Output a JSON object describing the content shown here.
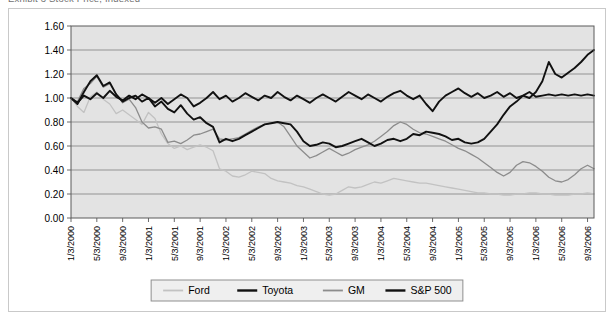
{
  "clipped_header": "Exhibit 3  Stock Price, Indexed",
  "chart_data": {
    "type": "line",
    "title": "",
    "xlabel": "",
    "ylabel": "",
    "ylim": [
      0.0,
      1.6
    ],
    "ytick_values": [
      0.0,
      0.2,
      0.4,
      0.6,
      0.8,
      1.0,
      1.2,
      1.4,
      1.6
    ],
    "ytick_labels": [
      "0.00",
      "0.20",
      "0.40",
      "0.60",
      "0.80",
      "1.00",
      "1.20",
      "1.40",
      "1.60"
    ],
    "grid": true,
    "legend_position": "bottom",
    "plot_bgcolor": "#e3e3e3",
    "x_tick_labels": [
      "1/3/2000",
      "5/3/2000",
      "9/3/2000",
      "1/3/2001",
      "5/3/2001",
      "9/3/2001",
      "1/3/2002",
      "5/3/2002",
      "9/3/2002",
      "1/3/2003",
      "5/3/2003",
      "9/3/2003",
      "1/3/2004",
      "5/3/2004",
      "9/3/2004",
      "1/3/2005",
      "5/3/2005",
      "9/3/2005",
      "1/3/2006",
      "5/3/2006",
      "9/3/2006"
    ],
    "x_tick_interval_months": 4,
    "n_points": 82,
    "series": [
      {
        "name": "Ford",
        "color": "#c2c2c2",
        "values": [
          1.0,
          0.93,
          0.88,
          1.01,
          1.05,
          0.99,
          0.95,
          0.87,
          0.9,
          0.86,
          0.82,
          0.78,
          0.88,
          0.83,
          0.7,
          0.62,
          0.58,
          0.6,
          0.57,
          0.59,
          0.61,
          0.59,
          0.56,
          0.41,
          0.39,
          0.35,
          0.34,
          0.36,
          0.39,
          0.38,
          0.37,
          0.33,
          0.31,
          0.3,
          0.29,
          0.27,
          0.26,
          0.24,
          0.22,
          0.2,
          0.19,
          0.2,
          0.23,
          0.26,
          0.25,
          0.26,
          0.28,
          0.3,
          0.29,
          0.31,
          0.33,
          0.32,
          0.31,
          0.3,
          0.29,
          0.29,
          0.28,
          0.27,
          0.26,
          0.25,
          0.24,
          0.23,
          0.22,
          0.21,
          0.21,
          0.2,
          0.2,
          0.19,
          0.19,
          0.2,
          0.2,
          0.21,
          0.21,
          0.2,
          0.2,
          0.19,
          0.19,
          0.19,
          0.2,
          0.2,
          0.21,
          0.2
        ]
      },
      {
        "name": "Toyota",
        "color": "#111111",
        "values": [
          1.0,
          0.95,
          1.05,
          1.14,
          1.19,
          1.1,
          1.13,
          1.03,
          0.97,
          1.0,
          1.02,
          0.97,
          1.0,
          0.93,
          0.97,
          0.91,
          0.88,
          0.94,
          0.87,
          0.82,
          0.84,
          0.79,
          0.76,
          0.63,
          0.66,
          0.64,
          0.66,
          0.69,
          0.72,
          0.75,
          0.78,
          0.79,
          0.8,
          0.79,
          0.78,
          0.72,
          0.64,
          0.6,
          0.61,
          0.63,
          0.62,
          0.59,
          0.6,
          0.62,
          0.64,
          0.66,
          0.63,
          0.6,
          0.62,
          0.65,
          0.66,
          0.64,
          0.66,
          0.7,
          0.69,
          0.72,
          0.71,
          0.7,
          0.68,
          0.65,
          0.66,
          0.63,
          0.62,
          0.63,
          0.66,
          0.72,
          0.78,
          0.86,
          0.93,
          0.97,
          1.02,
          1.0,
          1.05,
          1.14,
          1.3,
          1.2,
          1.17,
          1.21,
          1.25,
          1.3,
          1.36,
          1.4
        ]
      },
      {
        "name": "GM",
        "color": "#8c8c8c",
        "values": [
          1.0,
          0.97,
          1.08,
          1.12,
          1.18,
          1.09,
          1.12,
          1.03,
          0.96,
          0.99,
          0.92,
          0.8,
          0.75,
          0.76,
          0.74,
          0.63,
          0.64,
          0.62,
          0.65,
          0.69,
          0.7,
          0.72,
          0.74,
          0.66,
          0.65,
          0.66,
          0.67,
          0.7,
          0.73,
          0.76,
          0.78,
          0.79,
          0.8,
          0.76,
          0.68,
          0.6,
          0.55,
          0.5,
          0.52,
          0.55,
          0.58,
          0.55,
          0.52,
          0.54,
          0.57,
          0.59,
          0.61,
          0.64,
          0.68,
          0.72,
          0.77,
          0.8,
          0.78,
          0.74,
          0.71,
          0.7,
          0.68,
          0.66,
          0.64,
          0.61,
          0.58,
          0.56,
          0.53,
          0.5,
          0.46,
          0.42,
          0.38,
          0.35,
          0.38,
          0.44,
          0.47,
          0.46,
          0.43,
          0.39,
          0.34,
          0.31,
          0.3,
          0.32,
          0.36,
          0.41,
          0.44,
          0.41
        ]
      },
      {
        "name": "S&P 500",
        "color": "#111111",
        "values": [
          1.0,
          0.96,
          1.02,
          0.99,
          1.04,
          1.0,
          1.06,
          1.01,
          0.98,
          1.02,
          0.99,
          1.03,
          1.0,
          0.96,
          1.0,
          0.95,
          0.99,
          1.03,
          1.0,
          0.93,
          0.96,
          1.0,
          1.05,
          0.99,
          1.02,
          0.97,
          1.0,
          1.04,
          1.01,
          0.98,
          1.02,
          1.0,
          1.05,
          1.01,
          0.98,
          1.02,
          0.99,
          0.96,
          1.0,
          1.03,
          1.0,
          0.97,
          1.01,
          1.05,
          1.02,
          0.99,
          1.03,
          1.0,
          0.97,
          1.01,
          1.04,
          1.06,
          1.02,
          0.99,
          1.02,
          0.95,
          0.89,
          0.97,
          1.02,
          1.05,
          1.08,
          1.04,
          1.01,
          1.04,
          1.0,
          1.02,
          1.05,
          1.01,
          1.04,
          1.0,
          1.02,
          1.05,
          1.01,
          1.02,
          1.03,
          1.02,
          1.03,
          1.02,
          1.03,
          1.02,
          1.03,
          1.02
        ]
      }
    ]
  },
  "legend": {
    "entries": [
      {
        "label": "Ford",
        "color": "#c2c2c2"
      },
      {
        "label": "Toyota",
        "color": "#111111"
      },
      {
        "label": "GM",
        "color": "#8c8c8c"
      },
      {
        "label": "S&P 500",
        "color": "#111111"
      }
    ]
  }
}
